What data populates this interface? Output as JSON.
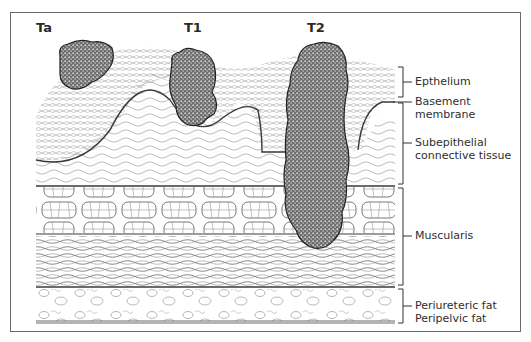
{
  "diagram": {
    "stages": [
      {
        "label": "Ta"
      },
      {
        "label": "T1"
      },
      {
        "label": "T2"
      }
    ],
    "layers": [
      {
        "label": "Epthelium"
      },
      {
        "label_line1": "Basement",
        "label_line2": "membrane"
      },
      {
        "label_line1": "Subepithelial",
        "label_line2": "connective tissue"
      },
      {
        "label": "Muscularis"
      },
      {
        "label_line1": "Periureteric fat",
        "label_line2": "Peripelvic fat"
      }
    ],
    "colors": {
      "line": "#3a3a3a",
      "tumor_fill": "#8a8a8a",
      "frame": "#6a6a6a"
    }
  }
}
